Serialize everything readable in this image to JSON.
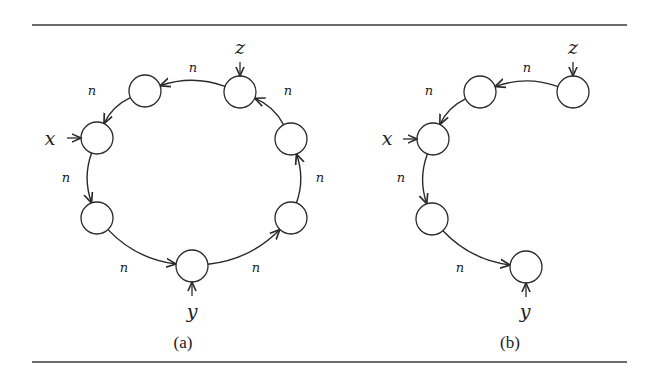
{
  "figure": {
    "rules": {
      "top_y": 25,
      "bottom_y": 362,
      "x1": 32,
      "x2": 627
    },
    "node_radius": 16,
    "edge_label": "n",
    "panels": [
      {
        "id": "a",
        "caption": "(a)",
        "caption_pos": [
          183,
          348
        ],
        "nodes": [
          {
            "id": "a1",
            "cx": 240,
            "cy": 92
          },
          {
            "id": "a2",
            "cx": 145,
            "cy": 91
          },
          {
            "id": "a3",
            "cx": 97,
            "cy": 138
          },
          {
            "id": "a4",
            "cx": 97,
            "cy": 218
          },
          {
            "id": "a5",
            "cx": 192,
            "cy": 266
          },
          {
            "id": "a6",
            "cx": 291,
            "cy": 218
          },
          {
            "id": "a7",
            "cx": 291,
            "cy": 139
          }
        ],
        "edges": [
          {
            "from": "a1",
            "to": "a2",
            "label": "n",
            "label_pos": [
              193,
              72
            ]
          },
          {
            "from": "a2",
            "to": "a3",
            "label": "n",
            "label_pos": [
              92,
              95
            ]
          },
          {
            "from": "a3",
            "to": "a4",
            "label": "n",
            "label_pos": [
              66,
              182
            ]
          },
          {
            "from": "a4",
            "to": "a5",
            "label": "n",
            "label_pos": [
              124,
              272
            ]
          },
          {
            "from": "a5",
            "to": "a6",
            "label": "n",
            "label_pos": [
              256,
              272
            ]
          },
          {
            "from": "a6",
            "to": "a7",
            "label": "n",
            "label_pos": [
              320,
              182
            ]
          },
          {
            "from": "a7",
            "to": "a1",
            "label": "n",
            "label_pos": [
              288,
              95
            ]
          }
        ],
        "pointers": [
          {
            "var": "z",
            "node": "a1",
            "dir": "down",
            "label_pos": [
              240,
              54
            ]
          },
          {
            "var": "x",
            "node": "a3",
            "dir": "right",
            "label_pos": [
              50,
              145
            ]
          },
          {
            "var": "y",
            "node": "a5",
            "dir": "up",
            "label_pos": [
              192,
              318
            ]
          }
        ]
      },
      {
        "id": "b",
        "caption": "(b)",
        "caption_pos": [
          510,
          348
        ],
        "nodes": [
          {
            "id": "b1",
            "cx": 573,
            "cy": 92
          },
          {
            "id": "b2",
            "cx": 480,
            "cy": 92
          },
          {
            "id": "b3",
            "cx": 433,
            "cy": 139
          },
          {
            "id": "b4",
            "cx": 432,
            "cy": 219
          },
          {
            "id": "b5",
            "cx": 526,
            "cy": 267
          }
        ],
        "edges": [
          {
            "from": "b1",
            "to": "b2",
            "label": "n",
            "label_pos": [
              527,
              72
            ]
          },
          {
            "from": "b2",
            "to": "b3",
            "label": "n",
            "label_pos": [
              429,
              95
            ]
          },
          {
            "from": "b3",
            "to": "b4",
            "label": "n",
            "label_pos": [
              401,
              182
            ]
          },
          {
            "from": "b4",
            "to": "b5",
            "label": "n",
            "label_pos": [
              460,
              272
            ]
          }
        ],
        "pointers": [
          {
            "var": "z",
            "node": "b1",
            "dir": "down",
            "label_pos": [
              573,
              54
            ]
          },
          {
            "var": "x",
            "node": "b3",
            "dir": "right",
            "label_pos": [
              387,
              145
            ]
          },
          {
            "var": "y",
            "node": "b5",
            "dir": "up",
            "label_pos": [
              525,
              318
            ]
          }
        ]
      }
    ]
  }
}
